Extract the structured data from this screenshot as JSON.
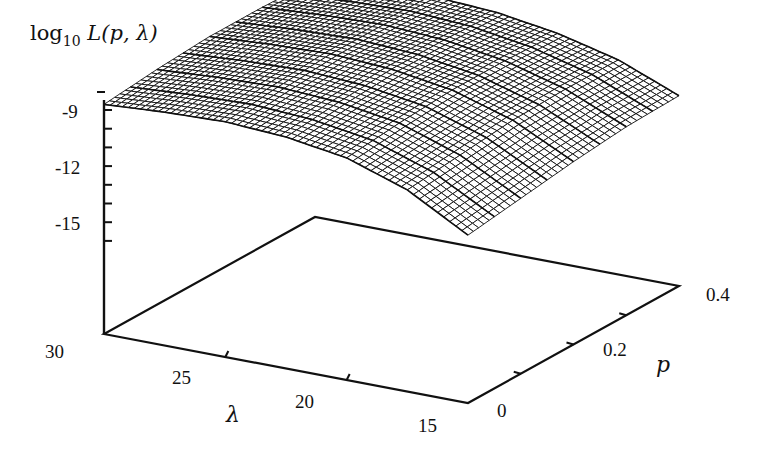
{
  "chart_data": {
    "type": "surface3d",
    "title": "",
    "zlabel": {
      "prefix": "log",
      "subscript": "10",
      "expr": " L(p, λ)"
    },
    "xlabel": "λ",
    "ylabel": "p",
    "axes": {
      "lambda": {
        "range": [
          15,
          30
        ],
        "ticks": [
          30,
          25,
          20,
          15
        ],
        "tick_labels": [
          "30",
          "25",
          "20",
          "15"
        ],
        "minor_step": 2.5
      },
      "p": {
        "range": [
          0,
          0.4
        ],
        "ticks": [
          0,
          0.2,
          0.4
        ],
        "tick_labels": [
          "0",
          "0.2",
          "0.4"
        ],
        "minor_step": 0.1
      },
      "z": {
        "range": [
          -17,
          -8.2
        ],
        "ticks": [
          -9,
          -12,
          -15
        ],
        "tick_labels": [
          "-9",
          "-12",
          "-15"
        ],
        "minor_step": 1
      }
    },
    "grid": false,
    "surface": {
      "description": "log10 likelihood surface over p in [0,0.4] and lambda in [15,30]; highest along back edge near lambda~25, lowest at front corner lambda=15, p=0",
      "lambda_samples": [
        30,
        27.5,
        25,
        22.5,
        20,
        17.5,
        15
      ],
      "p_samples": [
        0,
        0.1,
        0.2,
        0.3,
        0.4
      ],
      "z_values": [
        [
          -8.7,
          -8.5,
          -8.4,
          -8.6,
          -9.1,
          -10.2,
          -12.0
        ],
        [
          -8.4,
          -8.2,
          -8.1,
          -8.3,
          -8.8,
          -9.9,
          -11.6
        ],
        [
          -8.2,
          -8.0,
          -7.9,
          -8.1,
          -8.6,
          -9.6,
          -11.2
        ],
        [
          -8.2,
          -8.0,
          -7.9,
          -8.1,
          -8.6,
          -9.5,
          -10.9
        ],
        [
          -8.3,
          -8.1,
          -8.0,
          -8.2,
          -8.7,
          -9.5,
          -10.8
        ]
      ]
    },
    "colors": {
      "ink": "#111111",
      "surface_fill": "#ffffff",
      "background": "#ffffff"
    }
  }
}
